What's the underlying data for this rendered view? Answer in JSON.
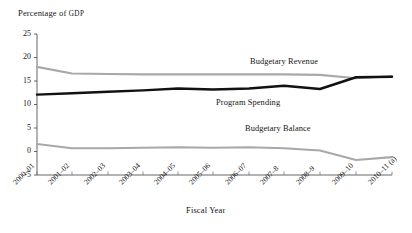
{
  "chart_data": {
    "type": "line",
    "title": "",
    "ylabel": "Percentage of GDP",
    "ylabel_main": "Percentage of ",
    "ylabel_smallcaps": "GDP",
    "xlabel": "Fiscal Year",
    "categories": [
      "2000–01",
      "2001–02",
      "2002–03",
      "2003–04",
      "2004–05",
      "2005–06",
      "2006–07",
      "2007–8",
      "2008–9",
      "2009–10",
      "2010–11 (a)"
    ],
    "ylim": [
      -5,
      25
    ],
    "yticks": [
      25,
      20,
      15,
      10,
      5,
      0,
      -5
    ],
    "ytick_labels": [
      "25",
      "20",
      "15",
      "10",
      "5",
      "0",
      "-5"
    ],
    "grid": false,
    "legend_position": "inline-annotations",
    "series": [
      {
        "name": "Program Spending",
        "color": "#a8a8a8",
        "width": 2.1,
        "values": [
          18.0,
          16.6,
          16.5,
          16.4,
          16.4,
          16.4,
          16.4,
          16.4,
          16.3,
          15.6,
          16.0
        ]
      },
      {
        "name": "Budgetary Revenue",
        "color": "#111111",
        "width": 2.4,
        "values": [
          12.1,
          12.4,
          12.7,
          13.0,
          13.4,
          13.2,
          13.4,
          14.0,
          13.3,
          15.8,
          15.9
        ]
      },
      {
        "name": "Budgetary Balance",
        "color": "#a8a8a8",
        "width": 2.1,
        "values": [
          1.6,
          0.7,
          0.7,
          0.8,
          0.9,
          0.8,
          0.9,
          0.7,
          0.2,
          -1.8,
          -1.2
        ]
      }
    ],
    "annotations": [
      {
        "text": "Budgetary Revenue",
        "x": 284,
        "y": 57
      },
      {
        "text": "Program Spending",
        "x": 248,
        "y": 98
      },
      {
        "text": "Budgetary Balance",
        "x": 278,
        "y": 124
      }
    ],
    "axis_geometry": {
      "x_positions": [
        37,
        72,
        108,
        143,
        178,
        213,
        249,
        284,
        320,
        356,
        392
      ],
      "y_top_value": 25,
      "y_top_px": 34,
      "y_bottom_value": -5,
      "y_bottom_px": 175,
      "axis_left_px": 37,
      "axis_right_px": 392,
      "zero_line_px": 151
    }
  }
}
